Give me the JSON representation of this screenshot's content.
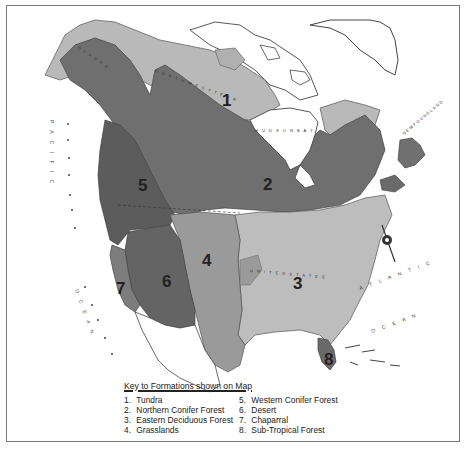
{
  "map": {
    "title": "Vegetation Formations of North America",
    "colors": {
      "tundra": "#b9b9b9",
      "northern_conifer": "#6f6f6f",
      "eastern_deciduous": "#bdbdbd",
      "grasslands": "#9a9a9a",
      "western_conifer": "#5c5c5c",
      "desert": "#646464",
      "chaparral": "#7d7d7d",
      "subtropical": "#6a6a6a",
      "land_unshaded": "#ffffff",
      "border": "#7a7a7a"
    },
    "region_labels": [
      {
        "id": "1",
        "x": 222,
        "y": 106
      },
      {
        "id": "2",
        "x": 263,
        "y": 190
      },
      {
        "id": "3",
        "x": 293,
        "y": 289
      },
      {
        "id": "4",
        "x": 202,
        "y": 266
      },
      {
        "id": "5",
        "x": 138,
        "y": 191
      },
      {
        "id": "6",
        "x": 162,
        "y": 287
      },
      {
        "id": "7",
        "x": 116,
        "y": 294
      },
      {
        "id": "8",
        "x": 324,
        "y": 365
      }
    ],
    "place_labels": {
      "pacific": "P A C I F I C",
      "pacific_ocean": "O C E A N",
      "atlantic": "A T L A N T I C",
      "atlantic_ocean": "O C E A N",
      "alaska": "A L A S K A",
      "northwest_territories": "N O R T H W E S T   T E R R",
      "hudson_bay": "H U D S O N   B A Y",
      "united_states": "U N I T E D   S T A T E S",
      "newfoundland": "NEWFOUNDLAND"
    }
  },
  "legend": {
    "title": "Key to Formations shown on Map",
    "items": [
      {
        "num": "1.",
        "label": "Tundra"
      },
      {
        "num": "2.",
        "label": "Northern Conifer Forest"
      },
      {
        "num": "3.",
        "label": "Eastern Deciduous Forest"
      },
      {
        "num": "4.",
        "label": "Grasslands"
      },
      {
        "num": "5.",
        "label": "Western Conifer Forest"
      },
      {
        "num": "6.",
        "label": "Desert"
      },
      {
        "num": "7.",
        "label": "Chaparral"
      },
      {
        "num": "8.",
        "label": "Sub-Tropical Forest"
      }
    ]
  }
}
